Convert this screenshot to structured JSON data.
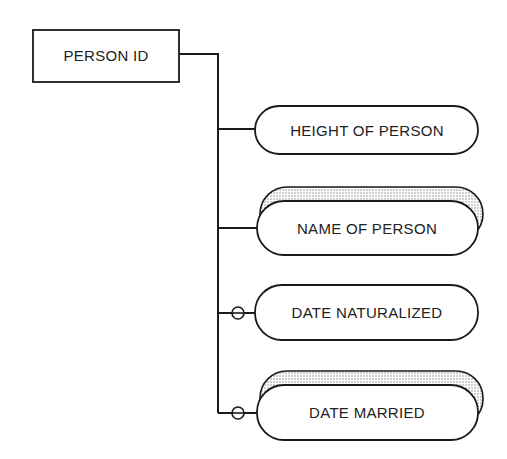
{
  "diagram": {
    "type": "data-structure-diagram",
    "key_entity": {
      "label": "PERSON ID"
    },
    "attributes": [
      {
        "label": "HEIGHT OF PERSON",
        "repeating": false,
        "optional": false
      },
      {
        "label": "NAME OF PERSON",
        "repeating": true,
        "optional": false
      },
      {
        "label": "DATE NATURALIZED",
        "repeating": false,
        "optional": true
      },
      {
        "label": "DATE MARRIED",
        "repeating": true,
        "optional": true
      }
    ]
  },
  "colors": {
    "stroke": "#1a1a1a",
    "fill": "#ffffff",
    "shadow_dots": "#888888"
  }
}
